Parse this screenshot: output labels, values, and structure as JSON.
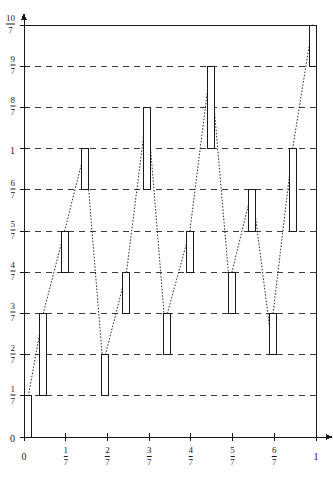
{
  "figure": {
    "type": "plot",
    "title": "",
    "background": "#ffffff",
    "ink": "#1a1a1a"
  },
  "chart_data": {
    "type": "line",
    "title": "",
    "xlabel": "",
    "ylabel": "",
    "xlim": [
      0,
      1
    ],
    "ylim": [
      0,
      1.4285714
    ],
    "grid": true,
    "grid_style": "dashed-horizontal",
    "legend": false,
    "x_ticks": [
      {
        "value": 0,
        "label": "0",
        "kind": "integer"
      },
      {
        "value": 0.1428571,
        "label": "1/7",
        "kind": "fraction",
        "num": "1",
        "den": "7"
      },
      {
        "value": 0.2857143,
        "label": "2/7",
        "kind": "fraction",
        "num": "2",
        "den": "7"
      },
      {
        "value": 0.4285714,
        "label": "3/7",
        "kind": "fraction",
        "num": "3",
        "den": "7"
      },
      {
        "value": 0.5714286,
        "label": "4/7",
        "kind": "fraction",
        "num": "4",
        "den": "7"
      },
      {
        "value": 0.7142857,
        "label": "5/7",
        "kind": "fraction",
        "num": "5",
        "den": "7"
      },
      {
        "value": 0.8571429,
        "label": "6/7",
        "kind": "fraction",
        "num": "6",
        "den": "7"
      },
      {
        "value": 1,
        "label": "1",
        "kind": "integer"
      }
    ],
    "y_ticks": [
      {
        "value": 0,
        "label": "0",
        "kind": "integer",
        "gridline": false
      },
      {
        "value": 0.1428571,
        "label": "1/7",
        "kind": "fraction",
        "num": "1",
        "den": "7",
        "gridline": true
      },
      {
        "value": 0.2857143,
        "label": "2/7",
        "kind": "fraction",
        "num": "2",
        "den": "7",
        "gridline": true
      },
      {
        "value": 0.4285714,
        "label": "3/7",
        "kind": "fraction",
        "num": "3",
        "den": "7",
        "gridline": true
      },
      {
        "value": 0.5714286,
        "label": "4/7",
        "kind": "fraction",
        "num": "4",
        "den": "7",
        "gridline": true
      },
      {
        "value": 0.7142857,
        "label": "5/7",
        "kind": "fraction",
        "num": "5",
        "den": "7",
        "gridline": true
      },
      {
        "value": 0.8571429,
        "label": "6/7",
        "kind": "fraction",
        "num": "6",
        "den": "7",
        "gridline": true
      },
      {
        "value": 1,
        "label": "1",
        "kind": "integer",
        "gridline": true
      },
      {
        "value": 1.1428571,
        "label": "8/7",
        "kind": "fraction",
        "num": "8",
        "den": "7",
        "gridline": true
      },
      {
        "value": 1.2857143,
        "label": "9/7",
        "kind": "fraction",
        "num": "9",
        "den": "7",
        "gridline": true
      },
      {
        "value": 1.4285714,
        "label": "10/7",
        "kind": "fraction",
        "num": "10",
        "den": "7",
        "gridline": false
      }
    ],
    "bars": [
      {
        "x": 0.015,
        "y0": 0.0,
        "y1": 0.1428571
      },
      {
        "x": 0.066,
        "y0": 0.1428571,
        "y1": 0.4285714
      },
      {
        "x": 0.139,
        "y0": 0.5714286,
        "y1": 0.7142857
      },
      {
        "x": 0.21,
        "y0": 0.8571429,
        "y1": 1.0
      },
      {
        "x": 0.279,
        "y0": 0.1428571,
        "y1": 0.2857143
      },
      {
        "x": 0.351,
        "y0": 0.4285714,
        "y1": 0.5714286
      },
      {
        "x": 0.422,
        "y0": 0.8571429,
        "y1": 1.1428571
      },
      {
        "x": 0.491,
        "y0": 0.2857143,
        "y1": 0.4285714
      },
      {
        "x": 0.568,
        "y0": 0.5714286,
        "y1": 0.7142857
      },
      {
        "x": 0.639,
        "y0": 1.0,
        "y1": 1.2857143
      },
      {
        "x": 0.712,
        "y0": 0.4285714,
        "y1": 0.5714286
      },
      {
        "x": 0.781,
        "y0": 0.7142857,
        "y1": 0.8571429
      },
      {
        "x": 0.853,
        "y0": 0.2857143,
        "y1": 0.4285714
      },
      {
        "x": 0.92,
        "y0": 0.7142857,
        "y1": 1.0
      },
      {
        "x": 0.988,
        "y0": 1.2857143,
        "y1": 1.4285714
      }
    ],
    "connectors": [
      {
        "from": [
          0.015,
          0.1428571
        ],
        "to": [
          0.066,
          0.4285714
        ]
      },
      {
        "from": [
          0.066,
          0.4285714
        ],
        "to": [
          0.139,
          0.7142857
        ]
      },
      {
        "from": [
          0.139,
          0.7142857
        ],
        "to": [
          0.21,
          1.0
        ]
      },
      {
        "from": [
          0.21,
          1.0
        ],
        "to": [
          0.279,
          0.1428571
        ]
      },
      {
        "from": [
          0.279,
          0.2857143
        ],
        "to": [
          0.351,
          0.5714286
        ]
      },
      {
        "from": [
          0.351,
          0.5714286
        ],
        "to": [
          0.422,
          1.1428571
        ]
      },
      {
        "from": [
          0.422,
          1.1428571
        ],
        "to": [
          0.491,
          0.2857143
        ]
      },
      {
        "from": [
          0.491,
          0.4285714
        ],
        "to": [
          0.568,
          0.7142857
        ]
      },
      {
        "from": [
          0.568,
          0.7142857
        ],
        "to": [
          0.639,
          1.2857143
        ]
      },
      {
        "from": [
          0.639,
          1.2857143
        ],
        "to": [
          0.712,
          0.4285714
        ]
      },
      {
        "from": [
          0.712,
          0.5714286
        ],
        "to": [
          0.781,
          0.8571429
        ]
      },
      {
        "from": [
          0.781,
          0.8571429
        ],
        "to": [
          0.853,
          0.2857143
        ]
      },
      {
        "from": [
          0.853,
          0.4285714
        ],
        "to": [
          0.92,
          1.0
        ]
      },
      {
        "from": [
          0.92,
          1.0
        ],
        "to": [
          0.988,
          1.4285714
        ]
      }
    ]
  }
}
